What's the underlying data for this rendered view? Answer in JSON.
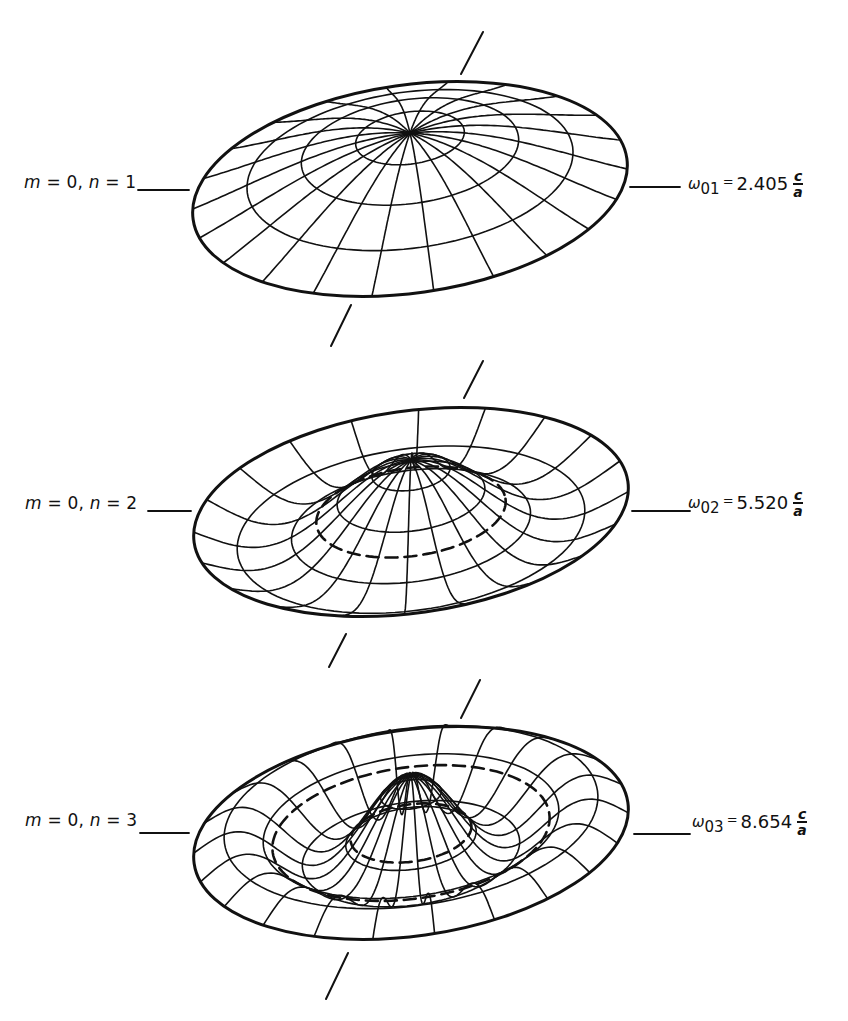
{
  "figure": {
    "type": "vibration-modes-circular-membrane",
    "stroke_color": "#111111",
    "background": "#ffffff",
    "modes": [
      {
        "id": "mode-01",
        "label": {
          "m_sym": "m",
          "m_val": "= 0,",
          "n_sym": "n",
          "n_val": "= 1"
        },
        "frequency": {
          "omega": "ω",
          "subscript": "01",
          "equals": "=",
          "value": "2.405",
          "numerator": "c",
          "denominator": "a"
        },
        "nodal_circle": "none"
      },
      {
        "id": "mode-02",
        "label": {
          "m_sym": "m",
          "m_val": "= 0,",
          "n_sym": "n",
          "n_val": "= 2"
        },
        "frequency": {
          "omega": "ω",
          "subscript": "02",
          "equals": "=",
          "value": "5.520",
          "numerator": "c",
          "denominator": "a"
        },
        "nodal_circle": "dashed, one inner"
      },
      {
        "id": "mode-03",
        "label": {
          "m_sym": "m",
          "m_val": "= 0,",
          "n_sym": "n",
          "n_val": "= 3"
        },
        "frequency": {
          "omega": "ω",
          "subscript": "03",
          "equals": "=",
          "value": "8.654",
          "numerator": "c",
          "denominator": "a"
        },
        "nodal_circle": "dashed, two"
      }
    ]
  }
}
